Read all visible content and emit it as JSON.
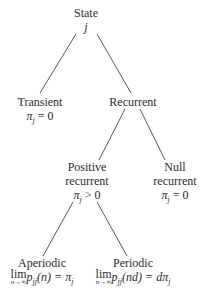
{
  "diagram": {
    "type": "tree",
    "nodes": [
      {
        "id": "state",
        "line1": "State",
        "line2": "j"
      },
      {
        "id": "transient",
        "line1": "Transient",
        "line2_pre": "π",
        "line2_sub": "j",
        "line2_post": " = 0"
      },
      {
        "id": "recurrent",
        "line1": "Recurrent"
      },
      {
        "id": "positive",
        "line1": "Positive",
        "line2": "recurrent",
        "line3_pre": "π",
        "line3_sub": "j",
        "line3_post": " > 0"
      },
      {
        "id": "null",
        "line1": "Null",
        "line2": "recurrent",
        "line3_pre": "π",
        "line3_sub": "j",
        "line3_post": " = 0"
      },
      {
        "id": "aperiodic",
        "line1": "Aperiodic",
        "lim": "lim",
        "lim_sub": "n→∞",
        "expr_p": "p",
        "expr_sub": "jj",
        "expr_arg": "(n)",
        "expr_rhs": " = π",
        "expr_rhs_sub": "j"
      },
      {
        "id": "periodic",
        "line1": "Periodic",
        "lim": "lim",
        "lim_sub": "n→∞",
        "expr_p": "p",
        "expr_sub": "jj",
        "expr_arg": "(nd)",
        "expr_rhs": " = dπ",
        "expr_rhs_sub": "j"
      }
    ],
    "edges": [
      [
        "state",
        "transient"
      ],
      [
        "state",
        "recurrent"
      ],
      [
        "recurrent",
        "positive"
      ],
      [
        "recurrent",
        "null"
      ],
      [
        "positive",
        "aperiodic"
      ],
      [
        "positive",
        "periodic"
      ]
    ]
  }
}
